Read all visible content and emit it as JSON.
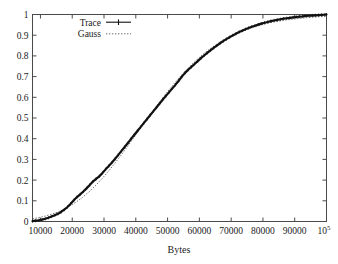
{
  "chart_data": {
    "type": "line",
    "title": "",
    "subtitle": "",
    "xlabel": "Bytes",
    "ylabel": "",
    "xlim": [
      7500,
      100000
    ],
    "ylim": [
      0,
      1
    ],
    "grid": false,
    "legend_position": "top-left",
    "xticks": [
      {
        "value": 10000,
        "label": "10000"
      },
      {
        "value": 20000,
        "label": "20000"
      },
      {
        "value": 30000,
        "label": "30000"
      },
      {
        "value": 40000,
        "label": "40000"
      },
      {
        "value": 50000,
        "label": "50000"
      },
      {
        "value": 60000,
        "label": "60000"
      },
      {
        "value": 70000,
        "label": "70000"
      },
      {
        "value": 80000,
        "label": "80000"
      },
      {
        "value": 90000,
        "label": "90000"
      },
      {
        "value": 100000,
        "label": "10",
        "superscript": "5"
      }
    ],
    "yticks": [
      {
        "value": 0,
        "label": "0"
      },
      {
        "value": 0.1,
        "label": "0.1"
      },
      {
        "value": 0.2,
        "label": "0.2"
      },
      {
        "value": 0.3,
        "label": "0.3"
      },
      {
        "value": 0.4,
        "label": "0.4"
      },
      {
        "value": 0.5,
        "label": "0.5"
      },
      {
        "value": 0.6,
        "label": "0.6"
      },
      {
        "value": 0.7,
        "label": "0.7"
      },
      {
        "value": 0.8,
        "label": "0.8"
      },
      {
        "value": 0.9,
        "label": "0.9"
      },
      {
        "value": 1,
        "label": "1"
      }
    ],
    "series": [
      {
        "name": "Trace",
        "style": "solid-with-points",
        "color": "#111111",
        "x": [
          7500,
          8500,
          9500,
          10500,
          11500,
          12500,
          13500,
          14500,
          15500,
          16500,
          17500,
          18500,
          19500,
          20500,
          21500,
          22500,
          23500,
          24500,
          25500,
          26500,
          27500,
          28500,
          29500,
          30500,
          31500,
          32500,
          33500,
          34500,
          35500,
          36500,
          37500,
          38500,
          39500,
          40500,
          41500,
          42500,
          43500,
          44500,
          45500,
          46500,
          47500,
          48500,
          49500,
          50500,
          51500,
          52500,
          53500,
          54500,
          55500,
          56500,
          57500,
          58500,
          59500,
          60500,
          61500,
          62500,
          63500,
          64500,
          65500,
          66500,
          67500,
          68500,
          69500,
          70500,
          71500,
          72500,
          73500,
          74500,
          75500,
          76500,
          77500,
          78500,
          79500,
          80500,
          81500,
          82500,
          83500,
          84500,
          85500,
          86500,
          87500,
          88500,
          89500,
          90500,
          91500,
          92500,
          93500,
          94500,
          95500,
          96500,
          97500,
          98500,
          99500,
          100000
        ],
        "y": [
          0.002,
          0.004,
          0.006,
          0.009,
          0.013,
          0.018,
          0.024,
          0.03,
          0.037,
          0.046,
          0.057,
          0.07,
          0.086,
          0.103,
          0.118,
          0.131,
          0.145,
          0.16,
          0.176,
          0.193,
          0.206,
          0.218,
          0.234,
          0.252,
          0.268,
          0.285,
          0.303,
          0.322,
          0.341,
          0.36,
          0.379,
          0.399,
          0.418,
          0.437,
          0.456,
          0.475,
          0.494,
          0.513,
          0.532,
          0.551,
          0.57,
          0.589,
          0.607,
          0.625,
          0.643,
          0.661,
          0.68,
          0.7,
          0.718,
          0.733,
          0.747,
          0.761,
          0.775,
          0.789,
          0.802,
          0.815,
          0.827,
          0.839,
          0.85,
          0.861,
          0.871,
          0.881,
          0.89,
          0.899,
          0.907,
          0.915,
          0.922,
          0.929,
          0.935,
          0.941,
          0.946,
          0.951,
          0.956,
          0.96,
          0.964,
          0.968,
          0.971,
          0.974,
          0.977,
          0.98,
          0.982,
          0.984,
          0.986,
          0.988,
          0.99,
          0.991,
          0.993,
          0.994,
          0.995,
          0.996,
          0.997,
          0.998,
          0.999,
          1.0
        ]
      },
      {
        "name": "Gauss",
        "style": "dotted",
        "color": "#5c5c5c",
        "x": [
          7500,
          9500,
          11500,
          13500,
          15500,
          17500,
          19500,
          21500,
          23500,
          25500,
          27500,
          29500,
          31500,
          33500,
          35500,
          37500,
          39500,
          41500,
          43500,
          45500,
          47500,
          49500,
          51500,
          53500,
          55500,
          57500,
          59500,
          61500,
          63500,
          65500,
          67500,
          69500,
          71500,
          73500,
          75500,
          77500,
          79500,
          81500,
          83500,
          85500,
          87500,
          89500,
          91500,
          93500,
          95500,
          97500,
          99500,
          100000
        ],
        "y": [
          0.013,
          0.019,
          0.026,
          0.035,
          0.046,
          0.06,
          0.077,
          0.097,
          0.12,
          0.146,
          0.176,
          0.209,
          0.245,
          0.283,
          0.323,
          0.365,
          0.408,
          0.451,
          0.494,
          0.537,
          0.578,
          0.618,
          0.656,
          0.692,
          0.726,
          0.757,
          0.786,
          0.812,
          0.836,
          0.857,
          0.876,
          0.893,
          0.908,
          0.921,
          0.932,
          0.942,
          0.95,
          0.958,
          0.964,
          0.969,
          0.974,
          0.978,
          0.981,
          0.984,
          0.987,
          0.989,
          0.991,
          0.991
        ]
      }
    ]
  },
  "legend": {
    "entries": [
      {
        "label": "Trace",
        "style": "solid-with-points"
      },
      {
        "label": "Gauss",
        "style": "dotted"
      }
    ]
  }
}
